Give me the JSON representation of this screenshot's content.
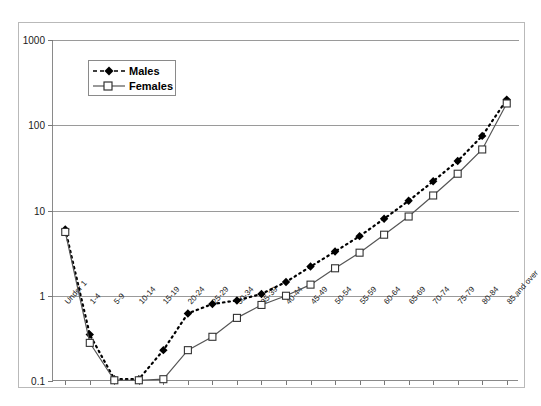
{
  "chart_data": {
    "type": "line",
    "title": "",
    "xlabel": "",
    "ylabel": "",
    "yscale": "log",
    "ylim": [
      0.1,
      1000
    ],
    "ytick_labels": [
      "1000",
      "100",
      "10",
      "1",
      "0.1"
    ],
    "ytick_values": [
      1000,
      100,
      10,
      1,
      0.1
    ],
    "grid": true,
    "legend_position": "upper-left-inside",
    "categories": [
      "Under 1",
      "1-4",
      "5-9",
      "10-14",
      "15-19",
      "20-24",
      "25-29",
      "30-34",
      "35-39",
      "40-44",
      "45-49",
      "50-54",
      "55-59",
      "60-64",
      "65-69",
      "70-74",
      "75-79",
      "80-84",
      "85 and over"
    ],
    "series": [
      {
        "name": "Males",
        "marker": "filled-diamond",
        "line_style": "dashed",
        "color": "#000000",
        "values": [
          6.0,
          0.35,
          0.105,
          0.105,
          0.23,
          0.62,
          0.8,
          0.88,
          1.05,
          1.45,
          2.2,
          3.3,
          5.0,
          8.0,
          13.0,
          22.0,
          38.0,
          75.0,
          200.0
        ]
      },
      {
        "name": "Females",
        "marker": "open-square",
        "line_style": "solid",
        "color": "#555555",
        "values": [
          5.6,
          0.28,
          0.102,
          0.102,
          0.105,
          0.23,
          0.33,
          0.55,
          0.78,
          1.0,
          1.35,
          2.1,
          3.2,
          5.2,
          8.5,
          15.0,
          27.0,
          52.0,
          180.0
        ]
      }
    ]
  },
  "legend": {
    "items": [
      {
        "label": "Males"
      },
      {
        "label": "Females"
      }
    ]
  }
}
